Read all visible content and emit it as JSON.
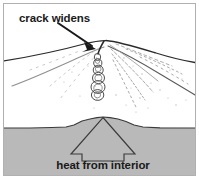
{
  "figure": {
    "caption_crack": "crack widens",
    "caption_heat": "heat from interior"
  },
  "colors": {
    "background": "#ffffff",
    "frame_border": "#b0b0b0",
    "ground_fill": "#b9b9b9",
    "ground_stroke": "#3a3a3a",
    "ink": "#1a1a1a",
    "slope_line": "#2b2b2b",
    "hatch_light": "#9a9a9a",
    "arrow_outline": "#3a3a3a"
  },
  "annotations": {
    "pointer_arrow": {
      "name": "crack-pointer-arrow",
      "from": [
        60,
        24
      ],
      "to": [
        96,
        49
      ]
    },
    "heat_arrow": {
      "name": "heat-arrow",
      "apex": [
        103,
        117
      ],
      "direction": "up"
    }
  },
  "geometry": {
    "frame": {
      "x": 3,
      "y": 3,
      "width": 193,
      "height": 173
    },
    "summit": [
      106,
      41
    ],
    "ground_line_y": 128,
    "dome_peak_y": 117
  }
}
